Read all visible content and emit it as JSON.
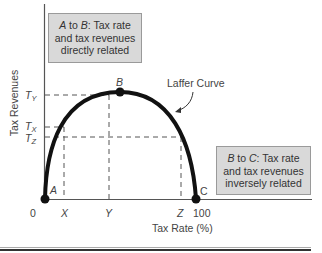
{
  "figure": {
    "title": "Laffer Curve",
    "curve_label": "Laffer Curve",
    "x_axis_label": "Tax Rate (%)",
    "y_axis_label": "Tax Revenues",
    "x_ticks": [
      "0",
      "X",
      "Y",
      "Z",
      "100"
    ],
    "y_ticks": [
      {
        "base": "T",
        "sub": "Y"
      },
      {
        "base": "T",
        "sub": "X"
      },
      {
        "base": "T",
        "sub": "Z"
      }
    ],
    "points": [
      {
        "label": "A",
        "desc": "tax rate 0, revenue 0"
      },
      {
        "label": "B",
        "desc": "peak revenue T_Y at tax rate Y"
      },
      {
        "label": "C",
        "desc": "tax rate 100, revenue 0"
      }
    ],
    "note_ab": {
      "from": "A",
      "to": "B",
      "mid": " to ",
      "text_line1": ": Tax rate",
      "text_line2": "and tax revenues",
      "text_line3": "directly related"
    },
    "note_bc": {
      "from": "B",
      "to": "C",
      "mid": " to ",
      "text_line1": ": Tax rate",
      "text_line2": "and tax revenues",
      "text_line3": "inversely related"
    },
    "colors": {
      "curve": "#111111",
      "axes": "#555555",
      "dashed": "#555555",
      "note_bg": "#d9d9d9",
      "note_border": "#9a9a9a"
    }
  }
}
